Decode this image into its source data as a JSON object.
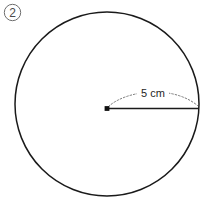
{
  "figure": {
    "item_number": "2",
    "item_number_icon": "circled-number-icon",
    "background_color": "#ffffff",
    "canvas": {
      "width": 203,
      "height": 200
    }
  },
  "circle": {
    "name": "circle-outline",
    "center_x": 107,
    "center_y": 104,
    "radius_px": 92,
    "stroke_color": "#1a1a1a",
    "stroke_width": 1.5
  },
  "center_point": {
    "name": "center-dot",
    "x": 107,
    "y": 108,
    "color": "#111111"
  },
  "radius": {
    "name": "radius-line",
    "start_x": 107,
    "start_y": 108,
    "end_x": 199,
    "end_y": 108,
    "stroke_color": "#1a1a1a",
    "label": "5 cm",
    "value": 5,
    "unit": "cm"
  },
  "dimension_arc": {
    "name": "dimension-arc",
    "style": "dotted",
    "stroke_color": "#7b7b7b",
    "start_x": 108,
    "start_y": 107,
    "peak_y": 87,
    "end_x": 198,
    "end_y": 106
  },
  "dimension_label": {
    "name": "dimension-label",
    "text": "5 cm",
    "x": 152,
    "y": 97,
    "color": "#1f1f1f"
  }
}
